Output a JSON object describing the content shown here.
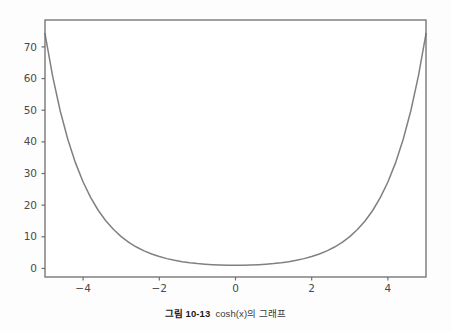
{
  "figure": {
    "background_color": "#fdfdfd",
    "caption_label": "그림 10-13",
    "caption_text": "cosh(x)의 그래프"
  },
  "chart_data": {
    "type": "line",
    "title": "",
    "xlabel": "",
    "ylabel": "",
    "xlim": [
      -5.0,
      5.0
    ],
    "ylim": [
      -2.7,
      78.5
    ],
    "grid": false,
    "legend": null,
    "line_color": "#808080",
    "line_width": 1.5,
    "spine_color": "#6e6e6e",
    "tick_label_color": "#4a4a4a",
    "xticks": [
      -4,
      -2,
      0,
      2,
      4
    ],
    "xticklabels": [
      "−4",
      "−2",
      "0",
      "2",
      "4"
    ],
    "yticks": [
      0,
      10,
      20,
      30,
      40,
      50,
      60,
      70
    ],
    "yticklabels": [
      "0",
      "10",
      "20",
      "30",
      "40",
      "50",
      "60",
      "70"
    ],
    "series": [
      {
        "name": "cosh(x)",
        "x": [
          -5.0,
          -4.8,
          -4.6,
          -4.4,
          -4.2,
          -4.0,
          -3.8,
          -3.6,
          -3.4,
          -3.2,
          -3.0,
          -2.8,
          -2.6,
          -2.4,
          -2.2,
          -2.0,
          -1.8,
          -1.6,
          -1.4,
          -1.2,
          -1.0,
          -0.8,
          -0.6,
          -0.4,
          -0.2,
          0.0,
          0.2,
          0.4,
          0.6,
          0.8,
          1.0,
          1.2,
          1.4,
          1.6,
          1.8,
          2.0,
          2.2,
          2.4,
          2.6,
          2.8,
          3.0,
          3.2,
          3.4,
          3.6,
          3.8,
          4.0,
          4.2,
          4.4,
          4.6,
          4.8,
          5.0
        ],
        "y": [
          74.21,
          60.76,
          49.75,
          40.73,
          33.35,
          27.31,
          22.36,
          18.31,
          15.0,
          12.29,
          10.07,
          8.25,
          6.77,
          5.56,
          4.57,
          3.76,
          3.11,
          2.58,
          2.15,
          1.81,
          1.54,
          1.34,
          1.19,
          1.08,
          1.02,
          1.0,
          1.02,
          1.08,
          1.19,
          1.34,
          1.54,
          1.81,
          2.15,
          2.58,
          3.11,
          3.76,
          4.57,
          5.56,
          6.77,
          8.25,
          10.07,
          12.29,
          15.0,
          18.31,
          22.36,
          27.31,
          33.35,
          40.73,
          49.75,
          60.76,
          74.21
        ]
      }
    ]
  }
}
